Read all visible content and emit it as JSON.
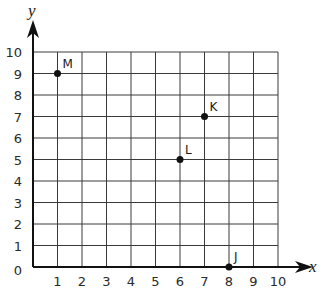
{
  "chart_data": {
    "type": "scatter",
    "title": "",
    "xlabel": "x",
    "ylabel": "y",
    "xlim": [
      0,
      10
    ],
    "ylim": [
      0,
      10
    ],
    "grid": true,
    "x_ticks": [
      "1",
      "2",
      "3",
      "4",
      "5",
      "6",
      "7",
      "8",
      "9",
      "10"
    ],
    "y_ticks": [
      "0",
      "1",
      "2",
      "3",
      "4",
      "5",
      "6",
      "7",
      "8",
      "9",
      "10"
    ],
    "points": [
      {
        "label": "M",
        "x": 1,
        "y": 9
      },
      {
        "label": "K",
        "x": 7,
        "y": 7
      },
      {
        "label": "L",
        "x": 6,
        "y": 5
      },
      {
        "label": "J",
        "x": 8,
        "y": 0
      }
    ],
    "colors": {
      "grid": "#3a3a3a",
      "axis": "#111111",
      "point": "#111111"
    }
  }
}
